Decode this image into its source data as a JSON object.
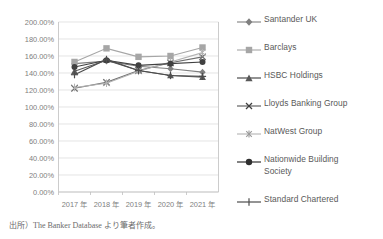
{
  "chart_data": {
    "type": "line",
    "title": "",
    "xlabel": "",
    "ylabel": "",
    "ylim": [
      0,
      200
    ],
    "ytick_values": [
      0,
      20,
      40,
      60,
      80,
      100,
      120,
      140,
      160,
      180,
      200
    ],
    "ytick_labels": [
      "0.00%",
      "20.00%",
      "40.00%",
      "60.00%",
      "80.00%",
      "100.00%",
      "120.00%",
      "140.00%",
      "160.00%",
      "180.00%",
      "200.00%"
    ],
    "categories": [
      "2017 年",
      "2018 年",
      "2019 年",
      "2020 年",
      "2021 年"
    ],
    "grid": true,
    "legend_position": "right",
    "series": [
      {
        "name": "Santander UK",
        "marker": "diamond",
        "color": "#808080",
        "values": [
          151.0,
          154.0,
          148.0,
          145.0,
          141.0
        ]
      },
      {
        "name": "Barclays",
        "marker": "square",
        "color": "#a6a6a6",
        "values": [
          153.0,
          169.0,
          159.0,
          160.0,
          170.0
        ]
      },
      {
        "name": "HSBC Holdings",
        "marker": "triangle",
        "color": "#595959",
        "values": [
          142.0,
          155.0,
          143.0,
          137.0,
          135.0
        ]
      },
      {
        "name": "Lloyds Banking Group",
        "marker": "x",
        "color": "#6e6e6e",
        "values": [
          122.0,
          129.0,
          143.0,
          152.0,
          159.0
        ]
      },
      {
        "name": "NatWest Group",
        "marker": "asterisk",
        "color": "#b3b3b3",
        "values": [
          123.0,
          128.0,
          142.0,
          153.0,
          164.0
        ]
      },
      {
        "name": "Nationwide Building Society",
        "marker": "circle",
        "color": "#404040",
        "values": [
          147.0,
          155.0,
          149.0,
          151.0,
          153.0
        ]
      },
      {
        "name": "Standard Chartered",
        "marker": "plus",
        "color": "#4d4d4d",
        "values": [
          138.0,
          156.0,
          143.0,
          137.0,
          136.0
        ]
      }
    ]
  },
  "legend": {
    "items": [
      {
        "label": "Santander UK"
      },
      {
        "label": "Barclays"
      },
      {
        "label": "HSBC Holdings"
      },
      {
        "label": "Lloyds Banking Group"
      },
      {
        "label": "NatWest Group"
      },
      {
        "label": "Nationwide Building",
        "label2": "Society"
      },
      {
        "label": "Standard Chartered"
      }
    ]
  },
  "caption": {
    "text": "出所）The Banker Database より筆者作成。"
  }
}
